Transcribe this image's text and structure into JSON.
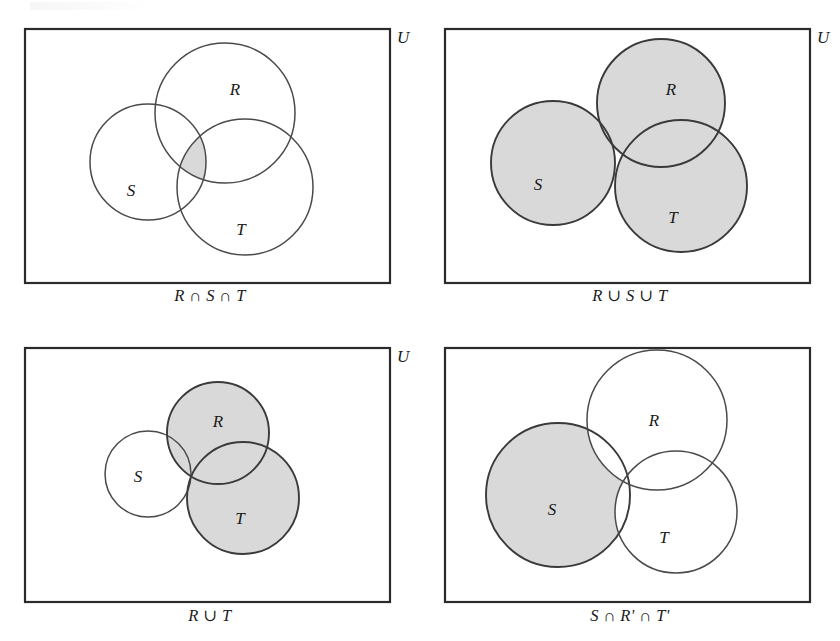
{
  "figure": {
    "type": "venn-diagram-set",
    "panel_count": 4,
    "universe_label": "U",
    "shade_color": "#d9d9d9",
    "outline_color": "#4a4a4a",
    "rect_color": "#2b2b2b",
    "background_color": "#ffffff"
  },
  "panels": [
    {
      "id": "panel-1",
      "caption": "R ∩ S ∩ T",
      "universe_label": "U",
      "shaded_region": "R ∩ S ∩ T",
      "labels": {
        "R": "R",
        "S": "S",
        "T": "T"
      },
      "rect": {
        "x": 25,
        "y": 29,
        "width": 365,
        "height": 254
      },
      "circles": {
        "R": {
          "cx": 225,
          "cy": 113,
          "r": 70
        },
        "S": {
          "cx": 148,
          "cy": 162,
          "r": 58
        },
        "T": {
          "cx": 245,
          "cy": 187,
          "r": 68
        }
      },
      "label_positions": {
        "R": {
          "x": 235,
          "y": 95
        },
        "S": {
          "x": 131,
          "y": 196
        },
        "T": {
          "x": 241,
          "y": 235
        }
      }
    },
    {
      "id": "panel-2",
      "caption": "R ∪ S ∪ T",
      "universe_label": "U",
      "shaded_region": "R ∪ S ∪ T",
      "labels": {
        "R": "R",
        "S": "S",
        "T": "T"
      },
      "rect": {
        "x": 445,
        "y": 29,
        "width": 365,
        "height": 254
      },
      "circles": {
        "R": {
          "cx": 661,
          "cy": 103,
          "r": 64
        },
        "S": {
          "cx": 553,
          "cy": 163,
          "r": 62
        },
        "T": {
          "cx": 681,
          "cy": 186,
          "r": 66
        }
      },
      "label_positions": {
        "R": {
          "x": 671,
          "y": 95
        },
        "S": {
          "x": 538,
          "y": 190
        },
        "T": {
          "x": 673,
          "y": 223
        }
      }
    },
    {
      "id": "panel-3",
      "caption": "R ∪ T",
      "universe_label": "U",
      "shaded_region": "R ∪ T",
      "labels": {
        "R": "R",
        "S": "S",
        "T": "T"
      },
      "rect": {
        "x": 25,
        "y": 348,
        "width": 365,
        "height": 254
      },
      "circles": {
        "R": {
          "cx": 218,
          "cy": 433,
          "r": 51
        },
        "S": {
          "cx": 148,
          "cy": 474,
          "r": 43
        },
        "T": {
          "cx": 243,
          "cy": 498,
          "r": 56
        }
      },
      "label_positions": {
        "R": {
          "x": 218,
          "y": 427
        },
        "S": {
          "x": 138,
          "y": 482
        },
        "T": {
          "x": 240,
          "y": 524
        }
      }
    },
    {
      "id": "panel-4",
      "caption": "S ∩ R' ∩ T'",
      "universe_label": "U",
      "shaded_region": "S ∩ R' ∩ T'",
      "labels": {
        "R": "R",
        "S": "S",
        "T": "T"
      },
      "rect": {
        "x": 445,
        "y": 348,
        "width": 365,
        "height": 254
      },
      "circles": {
        "R": {
          "cx": 657,
          "cy": 420,
          "r": 70
        },
        "S": {
          "cx": 558,
          "cy": 495,
          "r": 72
        },
        "T": {
          "cx": 676,
          "cy": 512,
          "r": 61
        }
      },
      "label_positions": {
        "R": {
          "x": 654,
          "y": 426
        },
        "S": {
          "x": 552,
          "y": 515
        },
        "T": {
          "x": 664,
          "y": 543
        }
      }
    }
  ]
}
